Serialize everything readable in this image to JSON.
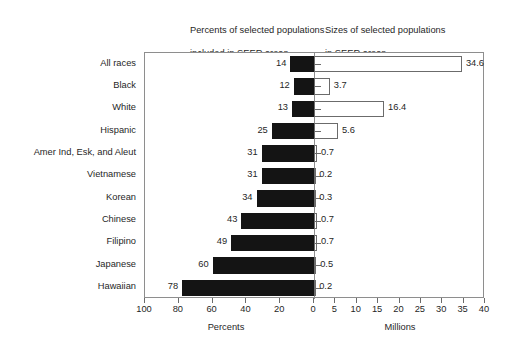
{
  "captions": {
    "left": "Percents of selected populations\ninclude in SEER areas",
    "left_line1": "Percents of selected populations",
    "left_line2": "included in SEER areas",
    "right_line1": "Sizes of selected populations",
    "right_line2": "in SEER areas"
  },
  "chart_data": {
    "type": "bar",
    "title": "",
    "subtitle": "",
    "orientation": "horizontal",
    "layout": "back-to-back bidirectional bars sharing category axis",
    "grid": false,
    "legend": null,
    "categories": [
      "All races",
      "Black",
      "White",
      "Hispanic",
      "Amer Ind, Esk, and Aleut",
      "Vietnamese",
      "Korean",
      "Chinese",
      "Filipino",
      "Japanese",
      "Hawaiian"
    ],
    "series": [
      {
        "name": "Percents of selected populations included in SEER areas",
        "units": "percent",
        "direction": "left",
        "axis": "bottom-left",
        "color": "#141414",
        "fill": "solid-black",
        "xlabel": "Percents",
        "xlim": [
          0,
          100
        ],
        "ticks": [
          100,
          80,
          60,
          40,
          20,
          0
        ],
        "values": [
          14,
          12,
          13,
          25,
          31,
          31,
          34,
          43,
          49,
          60,
          78
        ],
        "labels": [
          "14",
          "12",
          "13",
          "25",
          "31",
          "31",
          "34",
          "43",
          "49",
          "60",
          "78"
        ]
      },
      {
        "name": "Sizes of selected populations in SEER areas",
        "units": "millions",
        "direction": "right",
        "axis": "bottom-right",
        "color": "#ffffff",
        "fill": "white-with-gray-outline",
        "xlabel": "Millions",
        "xlim": [
          0,
          40
        ],
        "ticks": [
          0,
          5,
          10,
          15,
          20,
          25,
          30,
          35,
          40
        ],
        "values": [
          34.6,
          3.7,
          16.4,
          5.6,
          0.7,
          0.2,
          0.3,
          0.7,
          0.7,
          0.5,
          0.2
        ],
        "labels": [
          "34.6",
          "3.7",
          "16.4",
          "5.6",
          "0.7",
          "0.2",
          "0.3",
          "0.7",
          "0.7",
          "0.5",
          "0.2"
        ]
      }
    ]
  },
  "axes": {
    "left": {
      "title": "Percents",
      "tick_labels": [
        "100",
        "80",
        "60",
        "40",
        "20",
        "0"
      ]
    },
    "right": {
      "title": "Millions",
      "tick_labels": [
        "0",
        "5",
        "10",
        "15",
        "20",
        "25",
        "30",
        "35",
        "40"
      ]
    }
  },
  "colors": {
    "bar_percent": "#141414",
    "bar_millions": "#ffffff",
    "outline": "#6b6b6b",
    "frame": "#8e8e8e",
    "text": "#1f1f1f",
    "background": "#ffffff"
  }
}
